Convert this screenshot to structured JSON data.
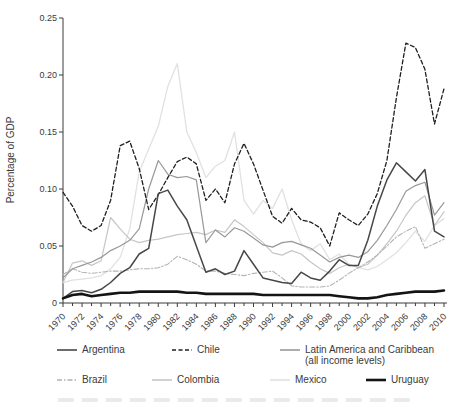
{
  "chart_data": {
    "type": "line",
    "title": "",
    "ylabel": "Percentage of GDP",
    "xlabel": "",
    "x_start": 1970,
    "x_end": 2010,
    "ylim": [
      0,
      0.25
    ],
    "grid": false,
    "legend_position": "bottom",
    "y_ticks": [
      0,
      0.05,
      0.1,
      0.15,
      0.2,
      0.25
    ],
    "y_tick_labels": [
      "0",
      "0.05",
      "0.10",
      "0.15",
      "0.20",
      "0.25"
    ],
    "x_tick_labels": [
      "1970",
      "1972",
      "1974",
      "1976",
      "1978",
      "1980",
      "1982",
      "1984",
      "1986",
      "1988",
      "1990",
      "1992",
      "1994",
      "1996",
      "1998",
      "2000",
      "2002",
      "2004",
      "2006",
      "2008",
      "2010"
    ],
    "series": [
      {
        "key": "mexico",
        "name": "Mexico",
        "color": "#e1e1e1",
        "width": 1.3,
        "dash": "",
        "values": [
          0.018,
          0.02,
          0.021,
          0.022,
          0.024,
          0.03,
          0.04,
          0.065,
          0.115,
          0.135,
          0.155,
          0.19,
          0.21,
          0.15,
          0.132,
          0.11,
          0.12,
          0.125,
          0.15,
          0.09,
          0.078,
          0.09,
          0.083,
          0.1,
          0.073,
          0.052,
          0.046,
          0.052,
          0.038,
          0.043,
          0.034,
          0.031,
          0.029,
          0.032,
          0.038,
          0.044,
          0.053,
          0.063,
          0.054,
          0.068,
          0.074
        ]
      },
      {
        "key": "colombia",
        "name": "Colombia",
        "color": "#c6c6c6",
        "width": 1.2,
        "dash": "",
        "values": [
          0.018,
          0.035,
          0.037,
          0.033,
          0.037,
          0.075,
          0.065,
          0.056,
          0.053,
          0.055,
          0.056,
          0.058,
          0.06,
          0.061,
          0.062,
          0.06,
          0.064,
          0.062,
          0.073,
          0.067,
          0.06,
          0.053,
          0.044,
          0.042,
          0.046,
          0.043,
          0.036,
          0.03,
          0.026,
          0.031,
          0.034,
          0.031,
          0.034,
          0.042,
          0.052,
          0.063,
          0.077,
          0.088,
          0.094,
          0.068,
          0.08
        ]
      },
      {
        "key": "brazil",
        "name": "Brazil",
        "color": "#b3b3b3",
        "width": 1.1,
        "dash": "5 2 1.5 2",
        "values": [
          0.025,
          0.03,
          0.027,
          0.026,
          0.027,
          0.028,
          0.028,
          0.029,
          0.03,
          0.03,
          0.031,
          0.034,
          0.041,
          0.038,
          0.034,
          0.028,
          0.028,
          0.026,
          0.025,
          0.024,
          0.026,
          0.027,
          0.028,
          0.022,
          0.015,
          0.014,
          0.014,
          0.014,
          0.015,
          0.02,
          0.026,
          0.031,
          0.036,
          0.042,
          0.05,
          0.058,
          0.063,
          0.067,
          0.048,
          0.052,
          0.056
        ]
      },
      {
        "key": "latam",
        "name": "Latin America and Caribbean (all income levels)",
        "color": "#989898",
        "width": 1.2,
        "dash": "",
        "values": [
          0.022,
          0.03,
          0.033,
          0.036,
          0.04,
          0.046,
          0.05,
          0.055,
          0.065,
          0.1,
          0.125,
          0.113,
          0.11,
          0.111,
          0.108,
          0.053,
          0.064,
          0.058,
          0.066,
          0.063,
          0.057,
          0.051,
          0.049,
          0.053,
          0.054,
          0.051,
          0.048,
          0.042,
          0.036,
          0.04,
          0.042,
          0.04,
          0.045,
          0.055,
          0.068,
          0.082,
          0.098,
          0.103,
          0.106,
          0.077,
          0.088
        ]
      },
      {
        "key": "chile",
        "name": "Chile",
        "color": "#1f1f1f",
        "width": 1.3,
        "dash": "4 2.5",
        "values": [
          0.097,
          0.085,
          0.068,
          0.063,
          0.068,
          0.09,
          0.138,
          0.142,
          0.118,
          0.082,
          0.095,
          0.11,
          0.124,
          0.128,
          0.122,
          0.09,
          0.1,
          0.088,
          0.122,
          0.14,
          0.122,
          0.099,
          0.076,
          0.07,
          0.083,
          0.073,
          0.071,
          0.066,
          0.05,
          0.079,
          0.073,
          0.068,
          0.078,
          0.096,
          0.125,
          0.18,
          0.228,
          0.224,
          0.205,
          0.157,
          0.188
        ]
      },
      {
        "key": "argentina",
        "name": "Argentina",
        "color": "#474747",
        "width": 1.5,
        "dash": "",
        "values": [
          0.004,
          0.01,
          0.011,
          0.009,
          0.012,
          0.018,
          0.026,
          0.031,
          0.043,
          0.048,
          0.096,
          0.099,
          0.085,
          0.073,
          0.05,
          0.027,
          0.03,
          0.025,
          0.028,
          0.046,
          0.034,
          0.022,
          0.02,
          0.018,
          0.017,
          0.027,
          0.022,
          0.02,
          0.028,
          0.038,
          0.033,
          0.033,
          0.055,
          0.085,
          0.108,
          0.123,
          0.115,
          0.107,
          0.117,
          0.063,
          0.058
        ]
      },
      {
        "key": "uruguay",
        "name": "Uruguay",
        "color": "#141414",
        "width": 2.6,
        "dash": "",
        "values": [
          0.004,
          0.007,
          0.008,
          0.006,
          0.007,
          0.008,
          0.009,
          0.009,
          0.01,
          0.01,
          0.01,
          0.01,
          0.01,
          0.009,
          0.009,
          0.008,
          0.008,
          0.008,
          0.008,
          0.008,
          0.008,
          0.007,
          0.007,
          0.007,
          0.007,
          0.007,
          0.007,
          0.007,
          0.007,
          0.006,
          0.005,
          0.004,
          0.004,
          0.005,
          0.007,
          0.008,
          0.009,
          0.01,
          0.01,
          0.01,
          0.011
        ]
      }
    ]
  },
  "legend": {
    "rows": [
      [
        {
          "series": "argentina",
          "label": "Argentina",
          "label2": ""
        },
        {
          "series": "chile",
          "label": "Chile",
          "label2": ""
        },
        {
          "series": "latam",
          "label": "Latin America and Caribbean",
          "label2": "(all income levels)"
        }
      ],
      [
        {
          "series": "brazil",
          "label": "Brazil",
          "label2": ""
        },
        {
          "series": "colombia",
          "label": "Colombia",
          "label2": ""
        },
        {
          "series": "mexico",
          "label": "Mexico",
          "label2": ""
        },
        {
          "series": "uruguay",
          "label": "Uruguay",
          "label2": ""
        }
      ]
    ]
  }
}
